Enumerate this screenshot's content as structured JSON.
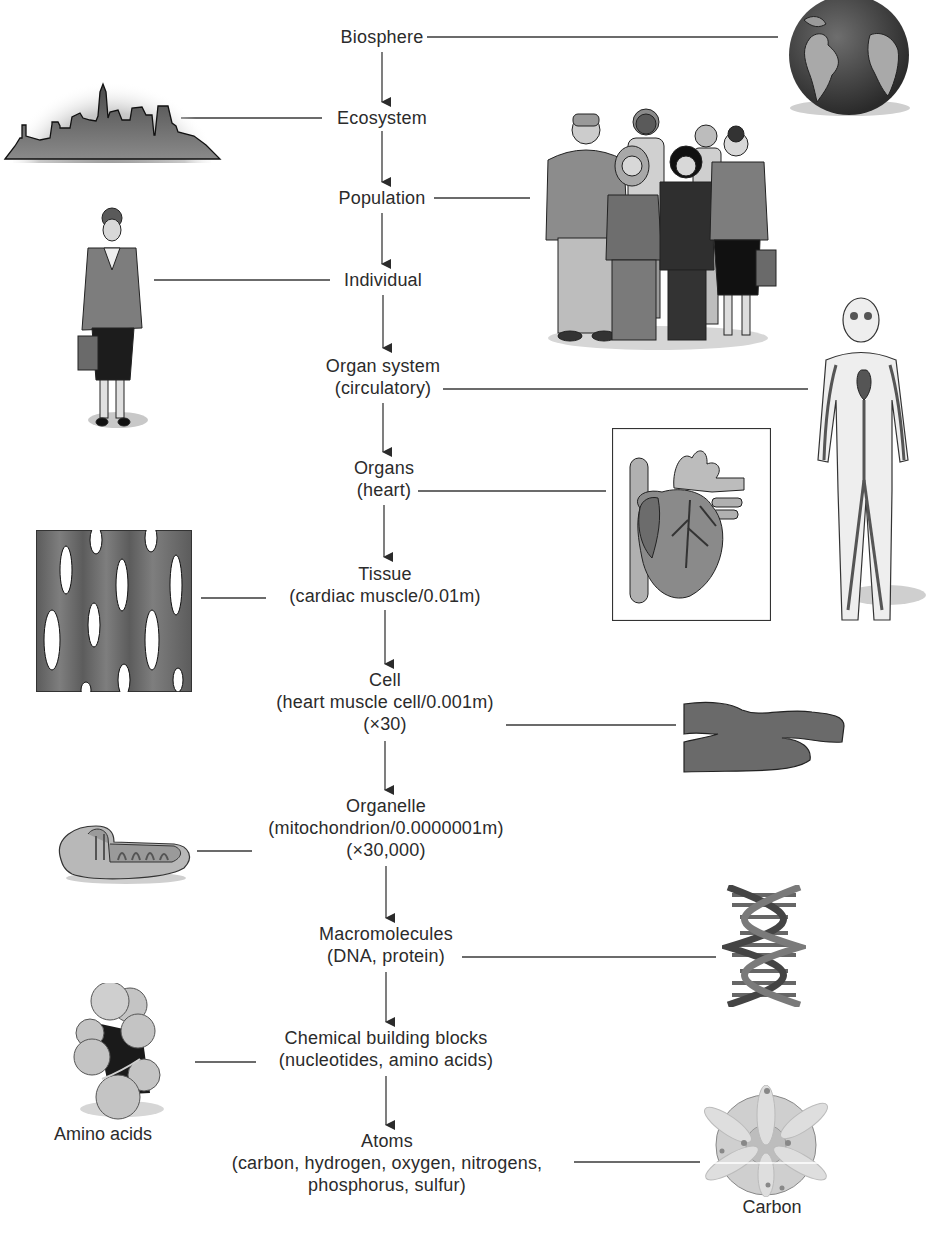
{
  "diagram": {
    "type": "hierarchy",
    "levels": [
      {
        "id": "biosphere",
        "lines": [
          "Biosphere"
        ],
        "illustration": "globe-icon",
        "side": "right"
      },
      {
        "id": "ecosystem",
        "lines": [
          "Ecosystem"
        ],
        "illustration": "city-skyline-icon",
        "side": "left"
      },
      {
        "id": "population",
        "lines": [
          "Population"
        ],
        "illustration": "group-of-people-icon",
        "side": "right"
      },
      {
        "id": "individual",
        "lines": [
          "Individual"
        ],
        "illustration": "woman-with-briefcase-icon",
        "side": "left"
      },
      {
        "id": "organ-system",
        "lines": [
          "Organ system",
          "(circulatory)"
        ],
        "illustration": "circulatory-system-icon",
        "side": "right"
      },
      {
        "id": "organs",
        "lines": [
          "Organs",
          "(heart)"
        ],
        "illustration": "heart-icon",
        "side": "right"
      },
      {
        "id": "tissue",
        "lines": [
          "Tissue",
          "(cardiac muscle/0.01m)"
        ],
        "illustration": "cardiac-tissue-icon",
        "side": "left"
      },
      {
        "id": "cell",
        "lines": [
          "Cell",
          "(heart muscle cell/0.001m)",
          "(×30)"
        ],
        "illustration": "muscle-cell-icon",
        "side": "right"
      },
      {
        "id": "organelle",
        "lines": [
          "Organelle",
          "(mitochondrion/0.0000001m)",
          "(×30,000)"
        ],
        "illustration": "mitochondrion-icon",
        "side": "left"
      },
      {
        "id": "macromolecules",
        "lines": [
          "Macromolecules",
          "(DNA, protein)"
        ],
        "illustration": "dna-helix-icon",
        "side": "right"
      },
      {
        "id": "chemical-building-blocks",
        "lines": [
          "Chemical building blocks",
          "(nucleotides, amino acids)"
        ],
        "illustration": "amino-acid-molecule-icon",
        "side": "left"
      },
      {
        "id": "atoms",
        "lines": [
          "Atoms",
          "(carbon, hydrogen, oxygen, nitrogens,",
          "phosphorus, sulfur)"
        ],
        "illustration": "carbon-atom-icon",
        "side": "right"
      }
    ],
    "captions": {
      "amino_acids": "Amino acids",
      "carbon": "Carbon"
    },
    "colors": {
      "text": "#2b2b2b",
      "line": "#3a3a3a",
      "dark_fill": "#555555",
      "mid_fill": "#888888",
      "light_fill": "#c8c8c8"
    }
  }
}
